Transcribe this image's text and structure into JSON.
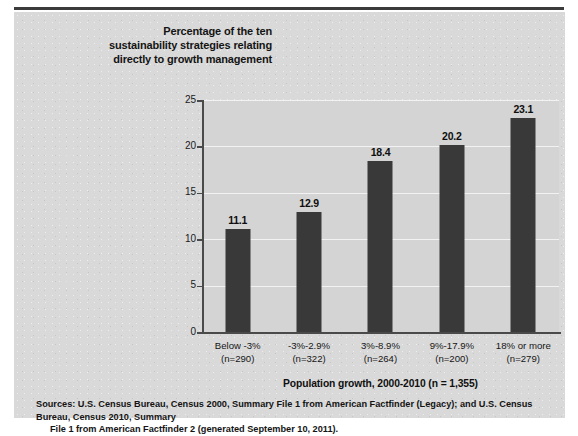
{
  "page": {
    "clipped_top_text": "",
    "background_color": "#ffffff",
    "panel_color": "#d9d9d9",
    "rule_color": "#3b3b3b"
  },
  "chart_data": {
    "type": "bar",
    "title": "Percentage of the ten sustainability strategies relating directly to growth management",
    "title_lines": [
      "Percentage of the ten",
      "sustainability strategies relating",
      "directly to growth management"
    ],
    "categories": [
      "Below -3%",
      "-3%-2.9%",
      "3%-8.9%",
      "9%-17.9%",
      "18% or more"
    ],
    "category_counts": [
      "(n=290)",
      "(n=322)",
      "(n=264)",
      "(n=200)",
      "(n=279)"
    ],
    "values": [
      11.1,
      12.9,
      18.4,
      20.2,
      23.1
    ],
    "value_labels": [
      "11.1",
      "12.9",
      "18.4",
      "20.2",
      "23.1"
    ],
    "xlabel": "Population growth, 2000-2010 (n = 1,355)",
    "ylabel": "",
    "ylim": [
      0,
      25
    ],
    "yticks": [
      0,
      5,
      10,
      15,
      20,
      25
    ],
    "ytick_labels": [
      "0",
      "5",
      "10",
      "15",
      "20",
      "25"
    ],
    "grid": true,
    "legend": false,
    "bar_color": "#393939",
    "gridline_color": "#f2f2f2",
    "axis_color": "#4a4a4a",
    "plot_background": "#d4d4d4"
  },
  "source": {
    "line1": "Sources: U.S. Census Bureau, Census 2000, Summary File 1 from American Factfinder (Legacy); and U.S. Census Bureau, Census 2010, Summary",
    "line2": "File 1 from American Factfinder 2 (generated September 10, 2011)."
  }
}
